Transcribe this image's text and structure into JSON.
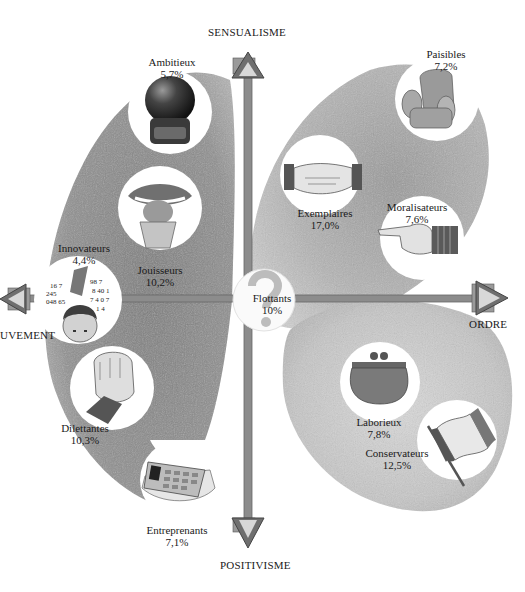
{
  "axes": {
    "top": "SENSUALISME",
    "bottom": "POSITIVISME",
    "left": "UVEMENT",
    "right": "ORDRE"
  },
  "colors": {
    "lobe_dark": "#8a8a8a",
    "lobe_mid": "#a8a8a8",
    "lobe_light": "#c9c9c9",
    "arrow": "#8c8c8c",
    "arrow_outline": "#5a5a5a",
    "circle_bg": "#ffffff"
  },
  "groups": [
    {
      "id": "ambitieux",
      "label": "Ambitieux",
      "pct": "5,7%",
      "icon": "crystal-ball-icon"
    },
    {
      "id": "jouisseurs",
      "label": "Jouisseurs",
      "pct": "10,2%",
      "icon": "lips-icon"
    },
    {
      "id": "innovateurs",
      "label": "Innovateurs",
      "pct": "4,4%",
      "icon": "thinking-head-icon"
    },
    {
      "id": "dilettantes",
      "label": "Dilettantes",
      "pct": "10,3%",
      "icon": "fist-icon"
    },
    {
      "id": "entreprenants",
      "label": "Entreprenants",
      "pct": "7,1%",
      "icon": "calculator-hand-icon"
    },
    {
      "id": "paisibles",
      "label": "Paisibles",
      "pct": "7,2%",
      "icon": "armchair-icon"
    },
    {
      "id": "exemplaires",
      "label": "Exemplaires",
      "pct": "17,0%",
      "icon": "handshake-icon"
    },
    {
      "id": "moralisateurs",
      "label": "Moralisateurs",
      "pct": "7,6%",
      "icon": "pointing-hand-icon"
    },
    {
      "id": "flottants",
      "label": "Flottants",
      "pct": "10%",
      "icon": "question-mark-icon"
    },
    {
      "id": "laborieux",
      "label": "Laborieux",
      "pct": "7,8%",
      "icon": "purse-icon"
    },
    {
      "id": "conservateurs",
      "label": "Conservateurs",
      "pct": "12,5%",
      "icon": "flag-icon"
    }
  ],
  "digits_text": [
    "16",
    "2 4 5",
    "0 4 8",
    "4 7",
    "98 3",
    "8 40",
    "7 4 0 7",
    "1 4"
  ]
}
